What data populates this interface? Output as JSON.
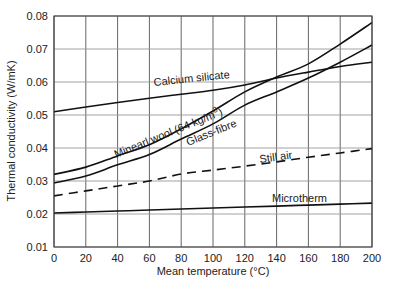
{
  "chart_data": {
    "type": "line",
    "title": "",
    "xlabel": "Mean temperature (°C)",
    "ylabel": "Thermal conductivity (W/mK)",
    "xlim": [
      0,
      200
    ],
    "ylim": [
      0.01,
      0.08
    ],
    "grid": true,
    "legend": "inline labels",
    "xticks": [
      "0",
      "20",
      "40",
      "60",
      "80",
      "100",
      "120",
      "140",
      "160",
      "180",
      "200"
    ],
    "yticks": [
      "0.01",
      "0.02",
      "0.03",
      "0.04",
      "0.05",
      "0.06",
      "0.07",
      "0.08"
    ],
    "x": [
      0,
      20,
      40,
      60,
      80,
      100,
      120,
      140,
      160,
      180,
      200
    ],
    "series": [
      {
        "name": "Calcium silicate",
        "style": "solid",
        "values": [
          0.051,
          0.0524,
          0.0538,
          0.0551,
          0.0563,
          0.0575,
          0.0591,
          0.0612,
          0.063,
          0.0647,
          0.066
        ]
      },
      {
        "name": "Minearl wool (64 kg/m³)",
        "style": "solid",
        "values": [
          0.032,
          0.0342,
          0.0376,
          0.041,
          0.0458,
          0.0512,
          0.057,
          0.0615,
          0.0655,
          0.0715,
          0.078
        ]
      },
      {
        "name": "Glass-fibre",
        "style": "solid",
        "values": [
          0.0294,
          0.0315,
          0.0349,
          0.038,
          0.0427,
          0.0473,
          0.053,
          0.057,
          0.0612,
          0.066,
          0.0712
        ]
      },
      {
        "name": "Still air",
        "style": "dashed",
        "values": [
          0.0255,
          0.027,
          0.0285,
          0.03,
          0.0321,
          0.0333,
          0.0345,
          0.0358,
          0.0372,
          0.0385,
          0.0398
        ]
      },
      {
        "name": "Microtherm",
        "style": "solid",
        "values": [
          0.0203,
          0.0206,
          0.0209,
          0.0212,
          0.0215,
          0.0218,
          0.0221,
          0.0224,
          0.0227,
          0.023,
          0.0233
        ]
      }
    ],
    "labels": {
      "calcium_silicate": "Calcium silicate",
      "mineral_wool": "Minearl wool (64 kg/m",
      "mineral_wool_sup": "3",
      "mineral_wool_end": ")",
      "glass_fibre": "Glass-fibre",
      "still_air": "Still air",
      "microtherm": "Microtherm"
    }
  }
}
